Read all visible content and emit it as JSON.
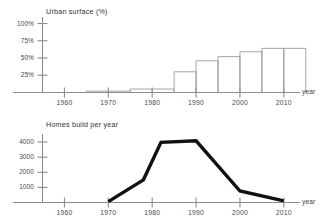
{
  "chart_data": [
    {
      "type": "bar",
      "id": "urban-surface",
      "title": "Urban surface (%)",
      "xlabel": "year",
      "ylabel": "",
      "categories": [
        1965,
        1970,
        1975,
        1980,
        1985,
        1990,
        1995,
        2000,
        2005,
        2010
      ],
      "values": [
        2,
        2,
        5,
        5,
        30,
        46,
        52,
        59,
        64,
        64
      ],
      "ytick_labels": [
        "100%",
        "75%",
        "50%",
        "25%"
      ],
      "ytick_values": [
        100,
        75,
        50,
        25
      ],
      "xtick_labels": [
        "1960",
        "1970",
        "1980",
        "1990",
        "2000",
        "2010"
      ],
      "xtick_values": [
        1960,
        1970,
        1980,
        1990,
        2000,
        2010
      ],
      "xlim": [
        1955,
        2013
      ],
      "ylim": [
        0,
        108
      ],
      "grid": false,
      "legend": "none"
    },
    {
      "type": "line",
      "id": "homes-built",
      "title": "Homes build per year",
      "xlabel": "year",
      "ylabel": "",
      "x": [
        1970,
        1978,
        1982,
        1990,
        2000,
        2010
      ],
      "values": [
        60,
        1500,
        3980,
        4080,
        760,
        110
      ],
      "ytick_labels": [
        "4000",
        "3000",
        "2000",
        "1000"
      ],
      "ytick_values": [
        4000,
        3000,
        2000,
        1000
      ],
      "xtick_labels": [
        "1960",
        "1970",
        "1980",
        "1990",
        "2000",
        "2010"
      ],
      "xtick_values": [
        1960,
        1970,
        1980,
        1990,
        2000,
        2010
      ],
      "xlim": [
        1955,
        2013
      ],
      "ylim": [
        0,
        4400
      ],
      "grid": false,
      "legend": "none"
    }
  ],
  "urban_surface": {
    "title": "Urban surface (%)",
    "axis_label_x": "year",
    "y_ticks": [
      "100%",
      "75%",
      "50%",
      "25%"
    ],
    "x_ticks": [
      "1960",
      "1970",
      "1980",
      "1990",
      "2000",
      "2010"
    ]
  },
  "homes_built": {
    "title": "Homes build per year",
    "axis_label_x": "year",
    "y_ticks": [
      "4000",
      "3000",
      "2000",
      "1000"
    ],
    "x_ticks": [
      "1960",
      "1970",
      "1980",
      "1990",
      "2000",
      "2010"
    ]
  },
  "colors": {
    "axis": "#8d8d8d",
    "bar_stroke": "#9a9a9a",
    "line": "#111111",
    "text": "#4a4a4a",
    "background": "#ffffff"
  }
}
